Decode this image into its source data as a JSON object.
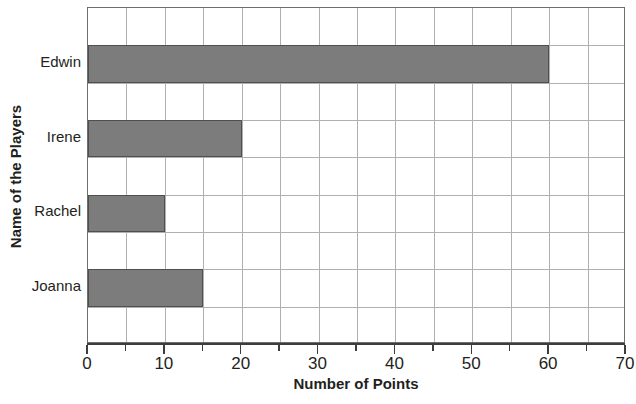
{
  "chart_data": {
    "type": "bar",
    "orientation": "horizontal",
    "title": "",
    "xlabel": "Number of Points",
    "ylabel": "Name of the Players",
    "categories": [
      "Edwin",
      "Irene",
      "Rachel",
      "Joanna"
    ],
    "values": [
      60,
      20,
      10,
      15
    ],
    "xlim": [
      0,
      70
    ],
    "xticks": [
      0,
      10,
      20,
      30,
      40,
      50,
      60,
      70
    ],
    "xtick_labels": [
      "0",
      "10",
      "20",
      "30",
      "40",
      "50",
      "60",
      "70"
    ],
    "minor_tick_step": 5,
    "grid": true,
    "legend": false,
    "bar_fill_color": "#7c7c7c",
    "bar_border_color": "#4f4f4f",
    "grid_color": "#b0b0b0",
    "axis_color": "#3d3d3d",
    "background_color": "#ffffff",
    "series": [
      {
        "name": "Points",
        "points": [
          {
            "category": "Edwin",
            "value": 60
          },
          {
            "category": "Irene",
            "value": 20
          },
          {
            "category": "Rachel",
            "value": 10
          },
          {
            "category": "Joanna",
            "value": 15
          }
        ]
      }
    ]
  }
}
